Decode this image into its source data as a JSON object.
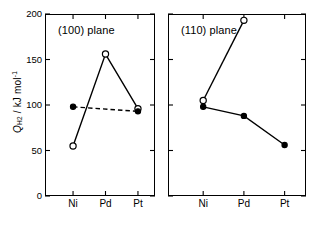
{
  "figure": {
    "ylabel_prefix": "Q",
    "ylabel_sub": "H2",
    "ylabel_rest": " / kJ mol",
    "ylabel_sup": "-1"
  },
  "chart_data": {
    "type": "line",
    "title": "",
    "xlabel": "",
    "ylabel": "Q_H2 / kJ mol^-1",
    "ylim": [
      0,
      200
    ],
    "yticks": [
      0,
      50,
      100,
      150,
      200
    ],
    "ytick_labels": [
      "0",
      "50",
      "100",
      "150",
      "200"
    ],
    "grid": false,
    "legend": "none",
    "categories": [
      "Ni",
      "Pd",
      "Pt"
    ],
    "panels": [
      {
        "label": "(100) plane",
        "categories": [
          "Ni",
          "Pd",
          "Pt"
        ],
        "series": [
          {
            "name": "open-circle-series",
            "marker": "open-circle",
            "linestyle": "solid",
            "x": [
              "Ni",
              "Pd",
              "Pt"
            ],
            "values": [
              55,
              156,
              96
            ]
          },
          {
            "name": "filled-circle-series",
            "marker": "filled-circle",
            "linestyle": "dashed",
            "x": [
              "Ni",
              "Pt"
            ],
            "values": [
              98,
              93
            ]
          }
        ]
      },
      {
        "label": "(110) plane",
        "categories": [
          "Ni",
          "Pd",
          "Pt"
        ],
        "series": [
          {
            "name": "open-circle-series",
            "marker": "open-circle",
            "linestyle": "solid",
            "x": [
              "Ni",
              "Pd"
            ],
            "values": [
              105,
              193
            ]
          },
          {
            "name": "filled-circle-series",
            "marker": "filled-circle",
            "linestyle": "solid",
            "x": [
              "Ni",
              "Pd",
              "Pt"
            ],
            "values": [
              98,
              88,
              56
            ]
          }
        ]
      }
    ]
  }
}
